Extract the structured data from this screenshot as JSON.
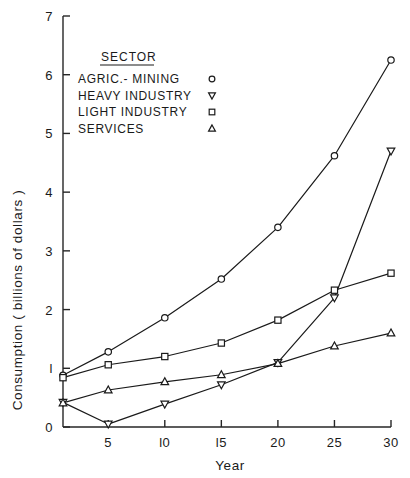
{
  "chart_data": {
    "type": "line",
    "title": "",
    "xlabel": "Year",
    "ylabel": "Consumption ( billions of dollars )",
    "x": [
      1,
      5,
      10,
      15,
      20,
      25,
      30
    ],
    "xlim": [
      1,
      30
    ],
    "ylim": [
      0,
      7
    ],
    "xticks": [
      5,
      10,
      15,
      20,
      25,
      30
    ],
    "xticklabels": [
      "5",
      "l0",
      "l5",
      "20",
      "25",
      "30"
    ],
    "yticks": [
      0,
      1,
      2,
      3,
      4,
      5,
      6,
      7
    ],
    "yticklabels": [
      "0",
      "l",
      "2",
      "3",
      "4",
      "5",
      "6",
      "7"
    ],
    "grid": false,
    "legend_position": "upper-left-inside",
    "legend_title": "SECTOR",
    "series": [
      {
        "name": "AGRIC.- MINING",
        "marker": "circle",
        "values": [
          0.88,
          1.28,
          1.86,
          2.52,
          3.4,
          4.62,
          6.25
        ]
      },
      {
        "name": "HEAVY INDUSTRY",
        "marker": "triangle-down",
        "values": [
          0.42,
          0.05,
          0.39,
          0.72,
          1.1,
          2.2,
          4.7
        ]
      },
      {
        "name": "LIGHT INDUSTRY",
        "marker": "square",
        "values": [
          0.84,
          1.06,
          1.2,
          1.43,
          1.82,
          2.33,
          2.62
        ]
      },
      {
        "name": "SERVICES",
        "marker": "triangle-up",
        "values": [
          0.41,
          0.63,
          0.77,
          0.89,
          1.08,
          1.38,
          1.6
        ]
      }
    ]
  },
  "axes": {
    "y_title": "Consumption ( billions of dollars )",
    "x_title": "Year"
  },
  "legend": {
    "title": "SECTOR",
    "entries": [
      {
        "label": "AGRIC.- MINING",
        "marker": "circle-icon"
      },
      {
        "label": "HEAVY INDUSTRY",
        "marker": "triangle-down-icon"
      },
      {
        "label": "LIGHT INDUSTRY",
        "marker": "square-icon"
      },
      {
        "label": "SERVICES",
        "marker": "triangle-up-icon"
      }
    ]
  },
  "colors": {
    "ink": "#1a1a1a",
    "background": "#ffffff",
    "marker_fill": "#ffffff"
  }
}
